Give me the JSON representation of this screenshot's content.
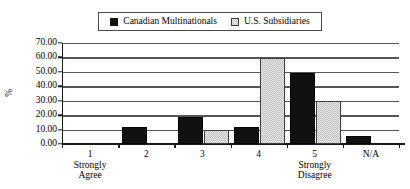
{
  "chart_data": {
    "type": "bar",
    "title": "",
    "subtitle": "",
    "xlabel": "",
    "ylabel": "%",
    "ylim": [
      0,
      70
    ],
    "ytick_step": 10,
    "ytick_labels": [
      "0.00",
      "10.00",
      "20.00",
      "30.00",
      "40.00",
      "50.00",
      "60.00",
      "70.00"
    ],
    "grid": true,
    "legend_position": "top-center",
    "categories": [
      "1",
      "2",
      "3",
      "4",
      "5",
      "N/A"
    ],
    "category_sublabels": [
      "Strongly Agree",
      "",
      "",
      "",
      "Strongly Disagree",
      ""
    ],
    "series": [
      {
        "name": "Canadian Multinationals",
        "color": "#111111",
        "values": [
          0,
          11.5,
          18.5,
          11.5,
          49.5,
          5.5
        ]
      },
      {
        "name": "U.S. Subsidiaries",
        "color": "#d9d9d9",
        "values": [
          0,
          0,
          9.5,
          59.5,
          29.5,
          0
        ]
      }
    ]
  },
  "legend": {
    "entries": [
      {
        "label": "Canadian Multinationals",
        "swatch": "filled-black-square-icon"
      },
      {
        "label": "U.S. Subsidiaries",
        "swatch": "checkered-gray-square-icon"
      }
    ]
  },
  "axes": {
    "y_title": "%",
    "y_ticks": [
      "70.00",
      "60.00",
      "50.00",
      "40.00",
      "30.00",
      "20.00",
      "10.00",
      "0.00"
    ],
    "x_categories": [
      {
        "label": "1",
        "sub1": "Strongly",
        "sub2": "Agree"
      },
      {
        "label": "2",
        "sub1": "",
        "sub2": ""
      },
      {
        "label": "3",
        "sub1": "",
        "sub2": ""
      },
      {
        "label": "4",
        "sub1": "",
        "sub2": ""
      },
      {
        "label": "5",
        "sub1": "Strongly",
        "sub2": "Disagree"
      },
      {
        "label": "N/A",
        "sub1": "",
        "sub2": ""
      }
    ]
  }
}
